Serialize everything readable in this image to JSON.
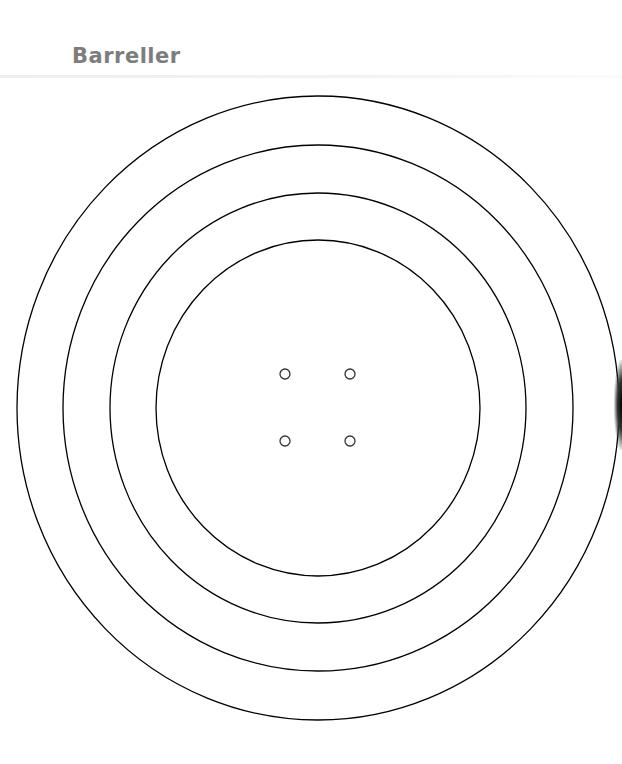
{
  "header": {
    "title": "Barreller"
  },
  "diagram": {
    "center": {
      "x": 318,
      "y": 408
    },
    "stroke_color": "#000000",
    "rings": [
      {
        "rx": 301,
        "ry": 312
      },
      {
        "rx": 255,
        "ry": 263
      },
      {
        "rx": 208,
        "ry": 215
      },
      {
        "rx": 162,
        "ry": 168
      }
    ],
    "holes": [
      {
        "x": 285,
        "y": 374,
        "r": 5
      },
      {
        "x": 350,
        "y": 374,
        "r": 5
      },
      {
        "x": 285,
        "y": 441,
        "r": 5
      },
      {
        "x": 350,
        "y": 441,
        "r": 5
      }
    ]
  }
}
